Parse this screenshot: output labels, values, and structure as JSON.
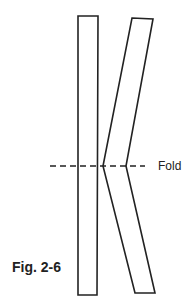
{
  "diagram": {
    "figure_label": "Fig. 2-6",
    "fold_label": "Fold",
    "colors": {
      "stroke": "#222222",
      "background": "#ffffff"
    },
    "shapes": [
      {
        "name": "straight-strip",
        "points": [
          [
            78,
            16
          ],
          [
            98,
            16
          ],
          [
            97,
            295
          ],
          [
            78,
            295
          ]
        ]
      },
      {
        "name": "folded-strip",
        "points": [
          [
            132,
            18
          ],
          [
            153,
            19
          ],
          [
            126,
            166
          ],
          [
            155,
            293
          ],
          [
            135,
            293
          ],
          [
            103,
            166
          ]
        ]
      }
    ],
    "fold_line": {
      "x1": 50,
      "x2": 145,
      "y": 166,
      "style": "dashed"
    }
  }
}
